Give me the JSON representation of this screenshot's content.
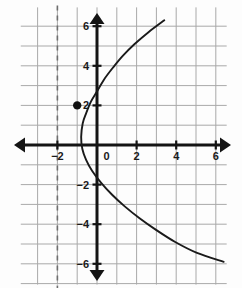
{
  "chart_data": {
    "type": "line",
    "title": "",
    "subtitle": "",
    "xlabel": "",
    "ylabel": "",
    "xlim": [
      -3.85,
      6.55
    ],
    "ylim": [
      -7.05,
      6.95
    ],
    "grid": true,
    "grid_step": 1,
    "legend": "none",
    "axes": {
      "x_axis_visible": true,
      "y_axis_visible": true,
      "arrows": "both-ends-both-axes",
      "origin_label": "0"
    },
    "xticks": [
      -2,
      0,
      2,
      4,
      6
    ],
    "xtick_labels": [
      "−2",
      "0",
      "2",
      "4",
      "6"
    ],
    "yticks": [
      6,
      4,
      2,
      -2,
      -4,
      -6
    ],
    "ytick_labels": [
      "6",
      "4",
      "2",
      "−2",
      "−4",
      "−6"
    ],
    "series": [
      {
        "name": "sideways-parabola",
        "type": "curve",
        "orientation": "opens-right",
        "vertex": [
          -0.8,
          0.4
        ],
        "color": "#1a1a1a",
        "points": [
          [
            3.4,
            6.3
          ],
          [
            2.6,
            5.7
          ],
          [
            1.9,
            5.1
          ],
          [
            1.3,
            4.5
          ],
          [
            0.8,
            3.9
          ],
          [
            0.35,
            3.3
          ],
          [
            0.0,
            2.7
          ],
          [
            -0.3,
            2.2
          ],
          [
            -0.55,
            1.6
          ],
          [
            -0.72,
            1.1
          ],
          [
            -0.8,
            0.4
          ],
          [
            -0.74,
            -0.2
          ],
          [
            -0.55,
            -0.75
          ],
          [
            -0.25,
            -1.3
          ],
          [
            0.2,
            -1.9
          ],
          [
            0.75,
            -2.5
          ],
          [
            1.4,
            -3.1
          ],
          [
            2.15,
            -3.7
          ],
          [
            3.0,
            -4.3
          ],
          [
            3.95,
            -4.9
          ],
          [
            5.05,
            -5.45
          ],
          [
            6.4,
            -5.9
          ]
        ]
      }
    ],
    "markers": [
      {
        "name": "marked-point",
        "x": -1,
        "y": 2,
        "style": "filled-circle",
        "color": "#111111",
        "radius_px": 4.2
      }
    ],
    "reference_lines": [
      {
        "name": "vertical-dashed-line",
        "orientation": "vertical",
        "x": -2,
        "style": "dashed",
        "color": "#6e6e6e"
      }
    ],
    "colors": {
      "grid": "#a9a9a9",
      "axis": "#141414",
      "curve": "#1a1a1a",
      "point": "#111111",
      "dashed_line": "#6e6e6e",
      "background": "#fdfdfd",
      "label": "#1a1a1a"
    }
  }
}
